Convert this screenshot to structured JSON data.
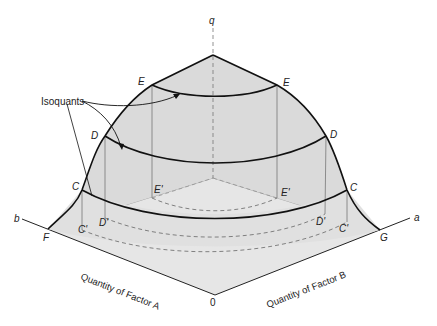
{
  "figure": {
    "type": "3D production surface with isoquants",
    "axes": {
      "vertical": "q",
      "left_axis": "b",
      "right_axis": "a",
      "origin": "0",
      "left_title": "Quantity of Factor A",
      "right_title": "Quantity of Factor B"
    },
    "annotation": "Isoquants",
    "points": {
      "E_left": "E",
      "E_right": "E",
      "D_left": "D",
      "D_right": "D",
      "C_left": "C",
      "C_right": "C",
      "E_proj_left": "E'",
      "E_proj_right": "E'",
      "D_proj_left": "D'",
      "D_proj_right": "D'",
      "C_proj_left": "C'",
      "C_proj_right": "C'",
      "F": "F",
      "G": "G"
    },
    "colors": {
      "surface_fill": "#dcdcdc",
      "floor_fill": "#e4e4e4",
      "stroke": "#111111",
      "thin_line": "#777777",
      "dashed": "#666666"
    }
  }
}
